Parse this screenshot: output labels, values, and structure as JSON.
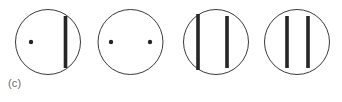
{
  "figure": {
    "panel_label": "(c)",
    "background_color": "#ffffff",
    "stroke_color": "#3a3a3a",
    "mark_color": "#262626",
    "circle_stroke_width": 1,
    "circle_radius": 32.5,
    "bar_width": 3.6,
    "dot_radius": 2.2,
    "circles": [
      {
        "name": "circle-1",
        "cx": 48,
        "cy": 42,
        "dots": [
          {
            "name": "dot-left",
            "cx": 31,
            "cy": 42
          }
        ],
        "bars": [
          {
            "name": "bar-right",
            "cx": 65.5,
            "y_top": 16,
            "y_bottom": 68
          }
        ]
      },
      {
        "name": "circle-2",
        "cx": 130.5,
        "cy": 42,
        "dots": [
          {
            "name": "dot-left",
            "cx": 111,
            "cy": 42
          },
          {
            "name": "dot-right",
            "cx": 150,
            "cy": 42
          }
        ],
        "bars": []
      },
      {
        "name": "circle-3",
        "cx": 216,
        "cy": 42,
        "dots": [],
        "bars": [
          {
            "name": "bar-left",
            "cx": 198,
            "y_top": 14,
            "y_bottom": 70
          },
          {
            "name": "bar-right",
            "cx": 227,
            "y_top": 16,
            "y_bottom": 68
          }
        ]
      },
      {
        "name": "circle-4",
        "cx": 297,
        "cy": 42,
        "dots": [],
        "bars": [
          {
            "name": "bar-left",
            "cx": 287,
            "y_top": 16,
            "y_bottom": 68
          },
          {
            "name": "bar-right",
            "cx": 308,
            "y_top": 16,
            "y_bottom": 68
          }
        ]
      }
    ]
  }
}
